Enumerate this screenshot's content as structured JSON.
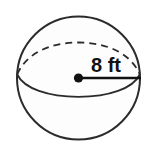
{
  "figure": {
    "name": "sphere-with-radius",
    "shape_label": "sphere",
    "radius_label": "8 ft",
    "radius_value": 8,
    "radius_unit": "ft",
    "colors": {
      "background": "#ffffff",
      "outline": "#2b2b2b",
      "fill": "#fdfdfd",
      "radius_line": "#111111",
      "label_text": "#111111"
    },
    "parts": {
      "outline_name": "sphere-outline",
      "front_equator_name": "equator-front-arc",
      "back_equator_name": "equator-back-arc-dashed",
      "center_name": "center-point",
      "radius_name": "radius-segment"
    }
  }
}
